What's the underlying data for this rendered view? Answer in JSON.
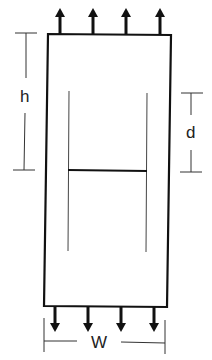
{
  "diagram": {
    "type": "tensile-specimen-center-crack",
    "colors": {
      "ink": "#111111",
      "thin": "#333333",
      "background": "#ffffff"
    },
    "labels": {
      "height": "h",
      "crack_length": "d",
      "width": "W"
    },
    "load": {
      "top_arrows": 4,
      "bottom_arrows": 4,
      "direction": "tension"
    }
  }
}
